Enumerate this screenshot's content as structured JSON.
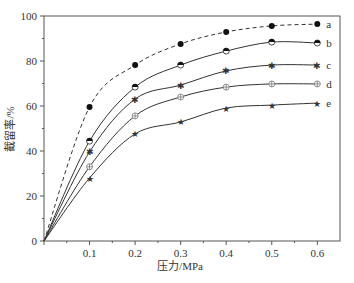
{
  "chart_data": {
    "type": "line",
    "title": "",
    "xlabel": "压力/MPa",
    "ylabel": "截留率/%",
    "xlim": [
      0,
      0.65
    ],
    "ylim": [
      0,
      100
    ],
    "xticks": [
      0.1,
      0.2,
      0.3,
      0.4,
      0.5,
      0.6
    ],
    "xtick_labels": [
      "0.1",
      "0.2",
      "0.3",
      "0.4",
      "0.5",
      "0.6"
    ],
    "yticks": [
      0,
      20,
      40,
      60,
      80,
      100
    ],
    "ytick_labels": [
      "0",
      "20",
      "40",
      "60",
      "80",
      "100"
    ],
    "grid": false,
    "legend_position": "right, inline labels at line ends",
    "x": [
      0,
      0.1,
      0.2,
      0.3,
      0.4,
      0.5,
      0.6
    ],
    "series": [
      {
        "name": "a",
        "line_style": "dashed",
        "marker": "filled-circle",
        "values": [
          0,
          59.6,
          78.2,
          87.6,
          92.9,
          95.6,
          96.4
        ]
      },
      {
        "name": "b",
        "line_style": "solid",
        "marker": "half-filled-circle",
        "values": [
          0,
          44.4,
          68.4,
          78.2,
          84.4,
          88.4,
          88.0
        ]
      },
      {
        "name": "c",
        "line_style": "solid",
        "marker": "star",
        "values": [
          0,
          39.6,
          63.1,
          69.3,
          75.6,
          78.2,
          78.2
        ]
      },
      {
        "name": "d",
        "line_style": "solid",
        "marker": "crossed-circle",
        "values": [
          0,
          33.0,
          55.6,
          64.0,
          68.4,
          69.8,
          69.8
        ]
      },
      {
        "name": "e",
        "line_style": "solid",
        "marker": "star-filled",
        "values": [
          0,
          28.0,
          47.6,
          52.9,
          59.1,
          60.4,
          61.3
        ]
      }
    ]
  }
}
